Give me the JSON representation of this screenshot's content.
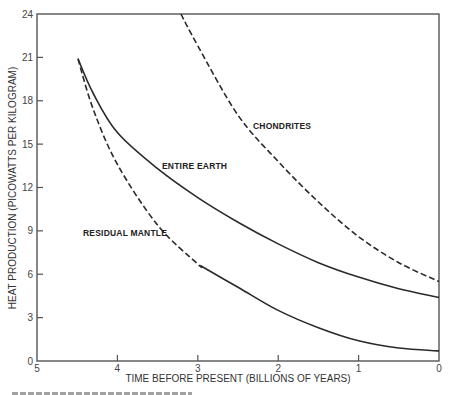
{
  "chart_data": {
    "type": "line",
    "title": "",
    "xlabel": "TIME BEFORE PRESENT (BILLIONS OF YEARS)",
    "ylabel": "HEAT PRODUCTION (PICOWATTS PER KILOGRAM)",
    "xlim": [
      5,
      0
    ],
    "ylim": [
      0,
      24
    ],
    "x_reversed": true,
    "x_ticks": [
      5,
      4,
      3,
      2,
      1,
      0
    ],
    "y_ticks": [
      0,
      3,
      6,
      9,
      12,
      15,
      18,
      21,
      24
    ],
    "grid": false,
    "legend": "none (curves labeled directly)",
    "series": [
      {
        "name": "CHONDRITES",
        "style": "dashed",
        "points": [
          [
            3.21,
            24
          ],
          [
            3.0,
            21.8
          ],
          [
            2.5,
            17.0
          ],
          [
            2.0,
            13.8
          ],
          [
            1.5,
            11.0
          ],
          [
            1.0,
            8.6
          ],
          [
            0.5,
            6.8
          ],
          [
            0,
            5.5
          ]
        ]
      },
      {
        "name": "ENTIRE EARTH",
        "style": "solid",
        "points": [
          [
            4.49,
            20.9
          ],
          [
            4.3,
            18.5
          ],
          [
            4.0,
            15.8
          ],
          [
            3.5,
            13.3
          ],
          [
            3.0,
            11.3
          ],
          [
            2.5,
            9.6
          ],
          [
            2.0,
            8.1
          ],
          [
            1.5,
            6.8
          ],
          [
            1.0,
            5.8
          ],
          [
            0.5,
            5.0
          ],
          [
            0,
            4.4
          ]
        ]
      },
      {
        "name": "RESIDUAL MANTLE",
        "style": "dashed until ~3.0 Gyr, then solid",
        "dash_until_t": 2.97,
        "points": [
          [
            4.49,
            20.9
          ],
          [
            4.3,
            17.4
          ],
          [
            4.0,
            13.6
          ],
          [
            3.5,
            9.4
          ],
          [
            3.0,
            6.7
          ],
          [
            2.5,
            5.1
          ],
          [
            2.0,
            3.5
          ],
          [
            1.5,
            2.3
          ],
          [
            1.0,
            1.4
          ],
          [
            0.5,
            0.9
          ],
          [
            0,
            0.7
          ]
        ]
      }
    ],
    "annotations": [
      {
        "text": "CHONDRITES",
        "x": 1.85,
        "y": 16.2
      },
      {
        "text": "ENTIRE EARTH",
        "x": 3.4,
        "y": 13.3
      },
      {
        "text": "RESIDUAL MANTLE",
        "x": 4.68,
        "y": 8.6
      }
    ]
  },
  "axes": {
    "x_title": "TIME BEFORE PRESENT (BILLIONS OF YEARS)",
    "y_title": "HEAT PRODUCTION (PICOWATTS PER KILOGRAM)",
    "x_tick_labels": [
      "5",
      "4",
      "3",
      "2",
      "1",
      "0"
    ],
    "y_tick_labels": [
      "0",
      "3",
      "6",
      "9",
      "12",
      "15",
      "18",
      "21",
      "24"
    ]
  },
  "labels": {
    "chondrites": "CHONDRITES",
    "entire_earth": "ENTIRE EARTH",
    "residual_mantle": "RESIDUAL MANTLE"
  },
  "colors": {
    "ink": "#2a2a2a",
    "frame": "#555555",
    "background": "#ffffff"
  }
}
